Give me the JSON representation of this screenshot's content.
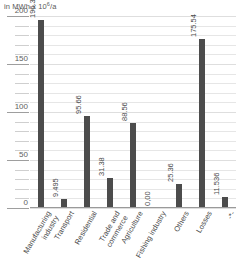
{
  "chart_data": {
    "type": "bar",
    "title": "",
    "subtitle": "",
    "xlabel": "",
    "ylabel": "in MWh x 10",
    "ylabel_exponent": "6",
    "ylabel_suffix": "/a",
    "ylabel_full": "in MWh x 10⁶/a",
    "ylim": [
      0,
      200
    ],
    "ymajor_step": 50,
    "yminor_step": 10,
    "grid": true,
    "legend": "none",
    "bar_color": "#4c4c4c",
    "categories": [
      "Manufacturing industry",
      "Transport",
      "Residential",
      "Trade and commerce",
      "Agriculture",
      "Fishing industry",
      "Others",
      "Losses",
      "-*-"
    ],
    "category_lines": [
      [
        "Manufacturing",
        "industry"
      ],
      [
        "Transport",
        ""
      ],
      [
        "Residential",
        ""
      ],
      [
        "Trade and",
        "commerce"
      ],
      [
        "Agriculture",
        ""
      ],
      [
        "Fishing industry",
        ""
      ],
      [
        "Others",
        ""
      ],
      [
        "Losses",
        ""
      ],
      [
        "-*-",
        ""
      ]
    ],
    "values": [
      196.3,
      9.495,
      95.66,
      31.38,
      88.56,
      0.0,
      25.36,
      175.54,
      11.536
    ],
    "value_labels": [
      "196.30",
      "9.495",
      "95.66",
      "31.38",
      "88.56",
      "0,00",
      "25.36",
      "175.54",
      "11.536"
    ],
    "yticks": [
      200,
      150,
      100,
      50,
      0
    ],
    "ytick_labels": [
      "200",
      "150",
      "100",
      "50",
      "0"
    ]
  }
}
